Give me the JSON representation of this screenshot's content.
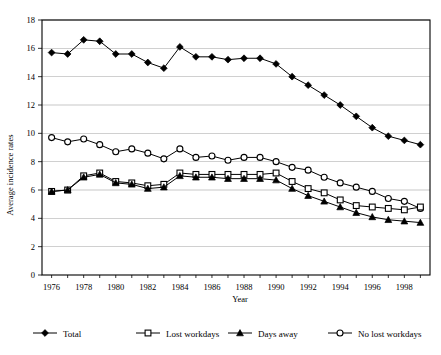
{
  "chart_data": {
    "type": "line",
    "title": "",
    "xlabel": "Year",
    "ylabel": "Average incidence rates",
    "xlim": [
      1975.4,
      1999.6
    ],
    "ylim": [
      0,
      18
    ],
    "yticks": [
      0,
      2,
      4,
      6,
      8,
      10,
      12,
      14,
      16,
      18
    ],
    "xticks": [
      1976,
      1978,
      1980,
      1982,
      1984,
      1986,
      1988,
      1990,
      1992,
      1994,
      1996,
      1998
    ],
    "x": [
      1976,
      1977,
      1978,
      1979,
      1980,
      1981,
      1982,
      1983,
      1984,
      1985,
      1986,
      1987,
      1988,
      1989,
      1990,
      1991,
      1992,
      1993,
      1994,
      1995,
      1996,
      1997,
      1998,
      1999
    ],
    "grid": true,
    "grid_axis": "y",
    "legend_position": "bottom",
    "series": [
      {
        "name": "Total",
        "marker": "filled-diamond",
        "values": [
          15.7,
          15.6,
          16.6,
          16.5,
          15.6,
          15.6,
          15.0,
          14.6,
          16.1,
          15.4,
          15.4,
          15.2,
          15.3,
          15.3,
          14.9,
          14.0,
          13.4,
          12.7,
          12.0,
          11.2,
          10.4,
          9.8,
          9.5,
          9.2
        ]
      },
      {
        "name": "Lost workdays",
        "marker": "open-square",
        "values": [
          5.9,
          6.0,
          7.0,
          7.2,
          6.6,
          6.5,
          6.3,
          6.4,
          7.2,
          7.1,
          7.1,
          7.1,
          7.1,
          7.1,
          7.2,
          6.6,
          6.1,
          5.8,
          5.3,
          4.9,
          4.8,
          4.7,
          4.6,
          4.8
        ]
      },
      {
        "name": "Days away",
        "marker": "filled-triangle",
        "values": [
          5.9,
          6.0,
          6.9,
          7.1,
          6.5,
          6.4,
          6.1,
          6.2,
          7.0,
          6.9,
          6.9,
          6.8,
          6.8,
          6.8,
          6.7,
          6.1,
          5.6,
          5.2,
          4.8,
          4.4,
          4.1,
          3.9,
          3.8,
          3.7
        ]
      },
      {
        "name": "No lost workdays",
        "marker": "open-circle",
        "values": [
          9.7,
          9.4,
          9.6,
          9.2,
          8.7,
          8.9,
          8.6,
          8.2,
          8.9,
          8.3,
          8.4,
          8.1,
          8.3,
          8.3,
          8.0,
          7.6,
          7.4,
          6.9,
          6.5,
          6.2,
          5.9,
          5.4,
          5.2,
          4.7
        ]
      }
    ]
  },
  "axes": {
    "y_title": "Average incidence rates",
    "x_title": "Year"
  },
  "legend": {
    "items": [
      {
        "label": "Total",
        "marker": "filled-diamond"
      },
      {
        "label": "Lost workdays",
        "marker": "open-square"
      },
      {
        "label": "Days away",
        "marker": "filled-triangle"
      },
      {
        "label": "No lost workdays",
        "marker": "open-circle"
      }
    ]
  },
  "colors": {
    "ink": "#000000",
    "background": "#ffffff",
    "grid": "#000000"
  }
}
